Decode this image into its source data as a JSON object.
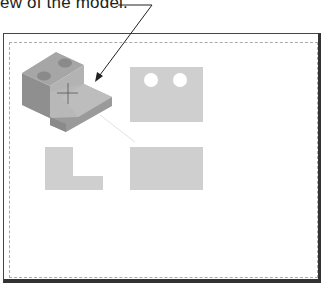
{
  "callout": {
    "text": "ew of the model."
  },
  "drawing": {
    "views": [
      {
        "name": "isometric-view",
        "label": "Isometric view"
      },
      {
        "name": "top-view",
        "label": "Top view",
        "holes": 2
      },
      {
        "name": "side-view",
        "label": "Side view (L profile)"
      },
      {
        "name": "front-view",
        "label": "Front view"
      }
    ],
    "colors": {
      "frame": "#333333",
      "dashed_border": "#aaaaaa",
      "view_fill": "#cfcfcf",
      "iso_top": "#a6a6a6",
      "iso_left": "#8f8f8f",
      "iso_right": "#b3b3b3"
    }
  }
}
